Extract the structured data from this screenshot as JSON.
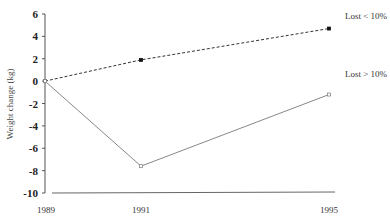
{
  "chart_data": {
    "type": "line",
    "title": "",
    "xlabel": "",
    "ylabel": "Weight change (kg)",
    "x": [
      1989,
      1991,
      1995
    ],
    "x_tick_labels": [
      "1989",
      "1991",
      "1995"
    ],
    "y_ticks": [
      6,
      4,
      2,
      0,
      -2,
      -4,
      -6,
      -8,
      -10
    ],
    "y_tick_labels": [
      "6",
      "4",
      "2",
      "0",
      "-2",
      "-4",
      "-6",
      "-8",
      "-10"
    ],
    "ylim": [
      -10,
      6
    ],
    "grid": false,
    "legend_position": "inline-right",
    "series": [
      {
        "name": "Lost < 10%",
        "values": [
          0,
          1.9,
          4.7
        ],
        "line_style": "dashed",
        "marker": "filled-square",
        "color": "#333333"
      },
      {
        "name": "Lost > 10%",
        "values": [
          0,
          -7.6,
          -1.2
        ],
        "line_style": "solid",
        "marker": "open-square",
        "color": "#888888"
      }
    ]
  }
}
